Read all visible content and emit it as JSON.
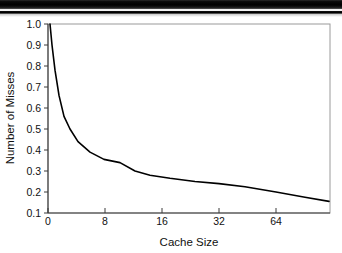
{
  "figure": {
    "background_color": "#ffffff",
    "page_artifact": {
      "name": "scan-edge-bars",
      "description": "black page-edge scan bars at top"
    }
  },
  "chart_data": {
    "type": "line",
    "title": "",
    "subtitle": "",
    "xlabel": "Cache Size",
    "ylabel": "Number of Misses",
    "grid": false,
    "legend": "none",
    "line_color": "#000000",
    "line_width": 1.6,
    "frame_color": "#9a9a9a",
    "axis_color": "#444444",
    "x_tick_labels": [
      "0",
      "8",
      "16",
      "32",
      "64"
    ],
    "x_tick_positions": [
      0,
      8,
      16,
      32,
      64
    ],
    "x_tick_pixels": [
      48,
      105,
      162,
      219,
      276
    ],
    "x_scale_note": "irregular/compressed scale: equal spacing between 0,8,16,32,64",
    "y_tick_labels": [
      "0.1",
      "0.2",
      "0.3",
      "0.4",
      "0.5",
      "0.6",
      "0.7",
      "0.8",
      "0.9",
      "1.0"
    ],
    "y_tick_values": [
      0.1,
      0.2,
      0.3,
      0.4,
      0.5,
      0.6,
      0.7,
      0.8,
      0.9,
      1.0
    ],
    "ylim": [
      0.1,
      1.0
    ],
    "xlim_pixels": [
      48,
      330
    ],
    "series": [
      {
        "name": "miss-ratio",
        "x_pixels": [
          50,
          52,
          55,
          59,
          64,
          70,
          78,
          90,
          104,
          120,
          135,
          150,
          170,
          195,
          219,
          245,
          276,
          305,
          329
        ],
        "values": [
          1.0,
          0.9,
          0.78,
          0.66,
          0.56,
          0.5,
          0.44,
          0.39,
          0.355,
          0.34,
          0.3,
          0.28,
          0.265,
          0.25,
          0.24,
          0.225,
          0.2,
          0.175,
          0.155
        ]
      }
    ],
    "annotations": []
  }
}
